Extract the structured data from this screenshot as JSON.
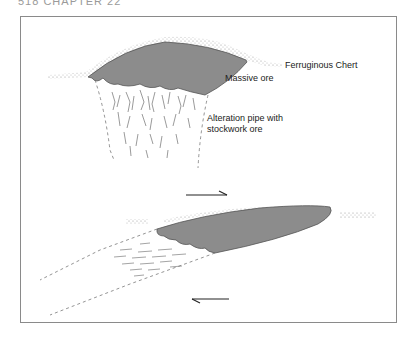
{
  "header": {
    "text": "518  CHAPTER 22"
  },
  "diagram": {
    "labels": {
      "chert": "Ferruginous Chert",
      "massive_ore": "Massive ore",
      "alteration_line1": "Alteration pipe with",
      "alteration_line2": "stockwork ore"
    },
    "colors": {
      "ore_fill": "#8c8c8c",
      "ore_stroke": "#555555",
      "chert_stipple": "#b5b5b5",
      "frame": "#8a8a8a",
      "line": "#333333"
    },
    "panels": [
      {
        "name": "upright",
        "description": "Undeformed massive sulphide lens with underlying alteration pipe"
      },
      {
        "name": "sheared",
        "description": "Sheared/flattened lens with alteration pipe drawn out along shear"
      }
    ],
    "arrows": [
      {
        "direction": "right",
        "position": "above lower lens"
      },
      {
        "direction": "left",
        "position": "below lower lens"
      }
    ]
  }
}
